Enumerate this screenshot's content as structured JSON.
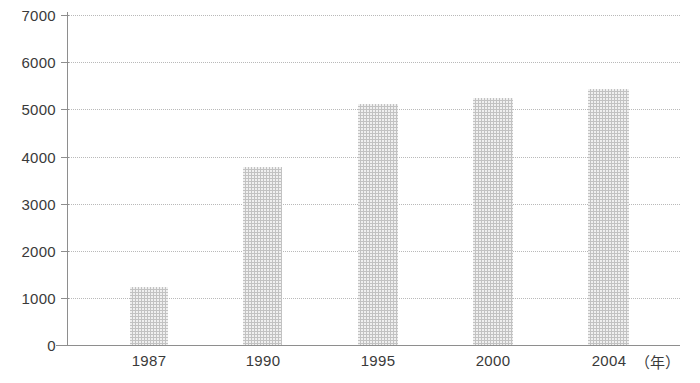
{
  "chart_data": {
    "type": "bar",
    "title": "",
    "subtitle": "",
    "xlabel": "（年）",
    "ylabel": "",
    "categories": [
      "1987",
      "1990",
      "1995",
      "2000",
      "2004"
    ],
    "values": [
      1230,
      3780,
      5110,
      5230,
      5430
    ],
    "series": [
      {
        "name": "",
        "values": [
          1230,
          3780,
          5110,
          5230,
          5430
        ]
      }
    ],
    "ylim": [
      0,
      7000
    ],
    "ytick_labels": [
      "0",
      "1000",
      "2000",
      "3000",
      "4000",
      "5000",
      "6000",
      "7000"
    ],
    "ytick_values": [
      0,
      1000,
      2000,
      3000,
      4000,
      5000,
      6000,
      7000
    ],
    "grid": true,
    "grid_style": "dotted-horizontal",
    "legend": "none",
    "legend_position": "none",
    "annotations": [],
    "colors": {
      "bar_fill": "#c2c2c2",
      "axis": "#8e8e8e",
      "gridline": "#b9b9b9",
      "text": "#3a3a3a",
      "background": "#ffffff"
    }
  },
  "axis_unit_label": "（年）"
}
